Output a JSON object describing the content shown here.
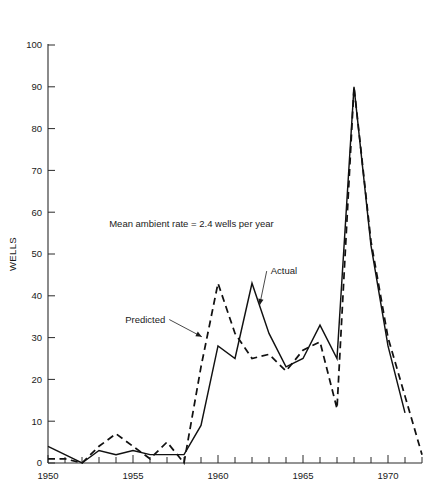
{
  "chart_data": {
    "type": "line",
    "title": "",
    "xlabel": "",
    "ylabel": "WELLS",
    "xlim": [
      1950,
      1972
    ],
    "ylim": [
      0,
      100
    ],
    "grid": false,
    "legend_position": "inline-annotations",
    "x_tick_labels": [
      "1950",
      "1955",
      "1960",
      "1965",
      "1970"
    ],
    "x_tick_values": [
      1950,
      1955,
      1960,
      1965,
      1970
    ],
    "x_minor_tick_step": 1,
    "y_tick_labels": [
      "0",
      "10",
      "20",
      "30",
      "40",
      "50",
      "60",
      "70",
      "80",
      "90",
      "100"
    ],
    "y_tick_values": [
      0,
      10,
      20,
      30,
      40,
      50,
      60,
      70,
      80,
      90,
      100
    ],
    "annotations": [
      {
        "id": "mean-ambient-rate",
        "text": "Mean ambient rate = 2.4 wells per year",
        "x": 1953.6,
        "y": 56.5
      }
    ],
    "series": [
      {
        "name": "Actual",
        "style": "solid",
        "label_x": 1962.8,
        "label_y": 45.0,
        "x": [
          1950,
          1951,
          1952,
          1953,
          1954,
          1955,
          1956,
          1957,
          1958,
          1959,
          1960,
          1961,
          1962,
          1963,
          1964,
          1965,
          1966,
          1967,
          1968,
          1969,
          1970,
          1971
        ],
        "values": [
          4,
          2,
          0,
          3,
          2,
          3,
          2,
          2,
          2,
          9,
          28,
          25,
          43,
          31,
          23,
          25,
          33,
          25,
          90,
          52,
          28,
          12
        ]
      },
      {
        "name": "Predicted",
        "style": "dashed",
        "label_x": 1956.1,
        "label_y": 33.5,
        "x": [
          1950,
          1951,
          1952,
          1953,
          1954,
          1955,
          1956,
          1957,
          1958,
          1959,
          1960,
          1961,
          1962,
          1963,
          1964,
          1965,
          1966,
          1967,
          1968,
          1969,
          1970,
          1971,
          1972
        ],
        "values": [
          1,
          1,
          0,
          4,
          7,
          4,
          1,
          5,
          0,
          23,
          43,
          31,
          25,
          26,
          22,
          27,
          29,
          13,
          90,
          53,
          30,
          16,
          2
        ]
      }
    ]
  },
  "colors": {
    "axis": "#2b2b2b",
    "series": "#111111",
    "background": "#ffffff"
  }
}
